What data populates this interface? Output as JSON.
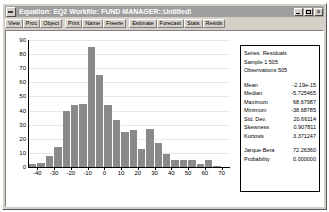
{
  "window": {
    "title": "Equation: EQ2   Workfile: FUND MANAGER::Untitled\\",
    "sysmenu_icon": "system-menu-icon",
    "minimize_icon": "minimize-icon",
    "maximize_icon": "maximize-icon",
    "close_icon": "close-icon"
  },
  "toolbar": {
    "buttons": [
      {
        "label": "View"
      },
      {
        "label": "Proc"
      },
      {
        "label": "Object"
      },
      {
        "label": "Print"
      },
      {
        "label": "Name"
      },
      {
        "label": "Freeze"
      },
      {
        "label": "Estimate"
      },
      {
        "label": "Forecast"
      },
      {
        "label": "Stats"
      },
      {
        "label": "Resids"
      }
    ]
  },
  "stats_panel": {
    "header": [
      {
        "label": "Series: Residuals"
      },
      {
        "label": "Sample 1 505"
      },
      {
        "label": "Observations 505"
      }
    ],
    "moments": [
      {
        "key": "Mean",
        "value": "-2.19e-15"
      },
      {
        "key": "Median",
        "value": "-5.725465"
      },
      {
        "key": "Maximum",
        "value": "68.67987"
      },
      {
        "key": "Minimum",
        "value": "-38.68785"
      },
      {
        "key": "Std. Dev.",
        "value": "20.66114"
      },
      {
        "key": "Skewness",
        "value": "0.907811"
      },
      {
        "key": "Kurtosis",
        "value": "3.371247"
      }
    ],
    "tests": [
      {
        "key": "Jarque-Bera",
        "value": "72.26360"
      },
      {
        "key": "Probability",
        "value": "0.000000"
      }
    ]
  },
  "chart_data": {
    "type": "bar",
    "title": "",
    "xlabel": "",
    "ylabel": "",
    "grid": true,
    "legend": "none",
    "xlim": [
      -45,
      75
    ],
    "ylim": [
      0,
      90
    ],
    "yticks": [
      0,
      10,
      20,
      30,
      40,
      50,
      60,
      70,
      80,
      90
    ],
    "xticks": [
      -40,
      -30,
      -20,
      -10,
      0,
      10,
      20,
      30,
      40,
      50,
      60,
      70
    ],
    "bin_width": 5,
    "bin_centers": [
      -42.5,
      -37.5,
      -32.5,
      -27.5,
      -22.5,
      -17.5,
      -12.5,
      -7.5,
      -2.5,
      2.5,
      7.5,
      12.5,
      17.5,
      22.5,
      27.5,
      32.5,
      37.5,
      42.5,
      47.5,
      52.5,
      57.5,
      62.5,
      67.5
    ],
    "bin_starts": [
      -45,
      -40,
      -35,
      -30,
      -25,
      -20,
      -15,
      -10,
      -5,
      0,
      5,
      10,
      15,
      20,
      25,
      30,
      35,
      40,
      45,
      50,
      55,
      60,
      65
    ],
    "values": [
      2,
      3,
      8,
      14,
      40,
      44,
      45,
      85,
      65,
      44,
      33,
      25,
      26,
      13,
      27,
      17,
      9,
      5,
      5,
      5,
      2,
      5,
      1
    ]
  }
}
